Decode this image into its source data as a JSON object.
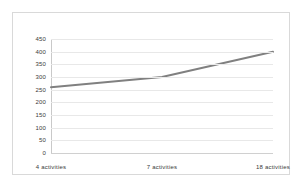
{
  "chart_data": {
    "type": "line",
    "title": "",
    "subtitle": "",
    "xlabel": "",
    "ylabel": "",
    "categories": [
      "4 activities",
      "7 activities",
      "18 activities"
    ],
    "series": [
      {
        "name": "",
        "values": [
          260,
          300,
          400
        ],
        "color": "#808080"
      }
    ],
    "ylim": [
      0,
      450
    ],
    "yticks": [
      0,
      50,
      100,
      150,
      200,
      250,
      300,
      350,
      400,
      450
    ],
    "ytick_labels": [
      "0",
      "50",
      "100",
      "150",
      "200",
      "250",
      "300",
      "350",
      "400",
      "450"
    ],
    "grid": true,
    "grid_axis": "y",
    "grid_color": "#e8e8e8",
    "legend": false,
    "legend_position": "none",
    "markers": false,
    "border_color": "#d9d9d9",
    "background_color": "#ffffff",
    "text_color": "#3a3a3a"
  }
}
